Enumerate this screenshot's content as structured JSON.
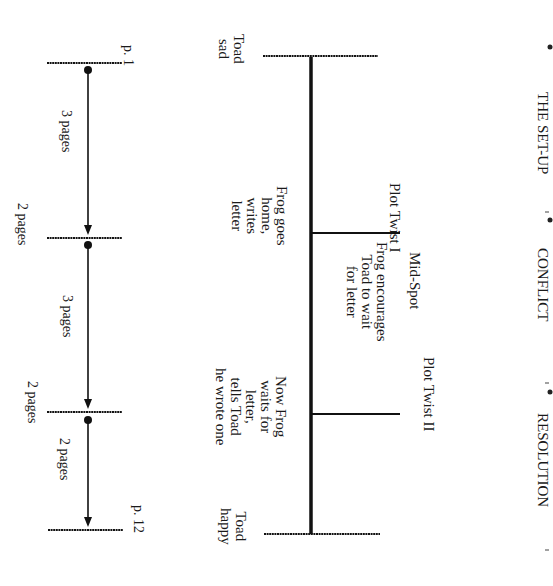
{
  "orientation": "rotated 90 degrees clockwise",
  "sections": {
    "setup": "THE SET-UP",
    "conflict": "CONFLICT",
    "resolution": "RESOLUTION"
  },
  "plot_points": {
    "start": "Toad\nsad",
    "plot_twist_1_label": "Plot Twist I",
    "plot_twist_1_event": "Frog goes\nhome,\nwrites\nletter",
    "mid_spot_label": "Mid-Spot",
    "mid_spot_event": "Frog encourages\nToad to wait\nfor letter",
    "plot_twist_2_label": "Plot Twist II",
    "plot_twist_2_event": "Now Frog\nwaits for\nletter,\ntells Toad\nhe wrote one",
    "end": "Toad\nhappy"
  },
  "page_timeline": {
    "start_page": "p. 1",
    "end_page": "p. 12",
    "segments": [
      {
        "label": "3 pages"
      },
      {
        "label": "3 pages"
      },
      {
        "label": "2 pages"
      }
    ],
    "gaps": [
      {
        "label": "2 pages"
      },
      {
        "label": "2 pages"
      }
    ]
  }
}
